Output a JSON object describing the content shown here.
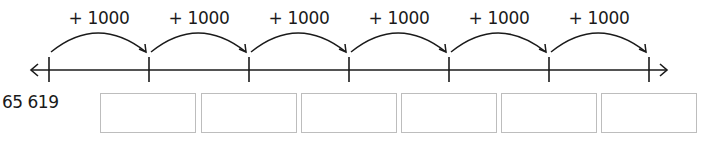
{
  "number_line": {
    "start_value": "65 619",
    "step_label": "+ 1000",
    "jumps": [
      {
        "label": "+ 1000"
      },
      {
        "label": "+ 1000"
      },
      {
        "label": "+ 1000"
      },
      {
        "label": "+ 1000"
      },
      {
        "label": "+ 1000"
      },
      {
        "label": "+ 1000"
      }
    ],
    "tick_count": 7,
    "answer_boxes": [
      {
        "value": ""
      },
      {
        "value": ""
      },
      {
        "value": ""
      },
      {
        "value": ""
      },
      {
        "value": ""
      },
      {
        "value": ""
      }
    ]
  },
  "colors": {
    "line": "#1a1a1a",
    "box_border": "#bdbdbd",
    "background": "#ffffff"
  }
}
